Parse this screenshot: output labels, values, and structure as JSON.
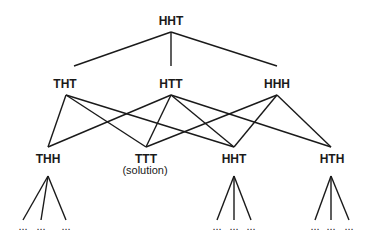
{
  "diagram": {
    "type": "search-tree",
    "root": {
      "label": "HHT"
    },
    "level1": [
      {
        "label": "THT"
      },
      {
        "label": "HTT"
      },
      {
        "label": "HHH"
      }
    ],
    "level2": [
      {
        "label": "THH",
        "note": ""
      },
      {
        "label": "TTT",
        "note": "(solution)"
      },
      {
        "label": "HHT",
        "note": ""
      },
      {
        "label": "HTH",
        "note": ""
      }
    ],
    "ellipsis": "...",
    "edges": [
      [
        "HHT",
        "THT"
      ],
      [
        "HHT",
        "HTT"
      ],
      [
        "HHT",
        "HHH"
      ],
      [
        "THT",
        "THH"
      ],
      [
        "THT",
        "TTT"
      ],
      [
        "THT",
        "HHT"
      ],
      [
        "HTT",
        "THH"
      ],
      [
        "HTT",
        "TTT"
      ],
      [
        "HTT",
        "HHT"
      ],
      [
        "HTT",
        "HTH"
      ],
      [
        "HHH",
        "TTT"
      ],
      [
        "HHH",
        "HHT"
      ],
      [
        "HHH",
        "HTH"
      ]
    ]
  }
}
